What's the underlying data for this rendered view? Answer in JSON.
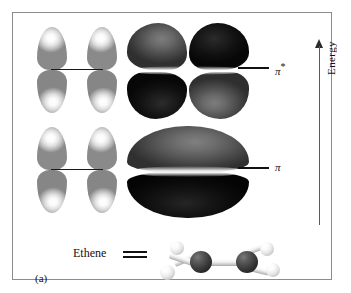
{
  "figure": {
    "caption": "(a)",
    "border_color": "#8c8c8c",
    "background": "#ffffff"
  },
  "energy_axis": {
    "label": "Energy",
    "direction": "up",
    "arrow_icon": "up-arrow-icon"
  },
  "energy_levels": [
    {
      "id": "antibonding",
      "symbol": "π",
      "superscript": "*",
      "label": "π*",
      "relative_energy": "higher"
    },
    {
      "id": "bonding",
      "symbol": "π",
      "superscript": "",
      "label": "π",
      "relative_energy": "lower"
    }
  ],
  "orbital_diagrams": [
    {
      "id": "p-orbital-pair-antibonding",
      "type": "atomic-p-orbital-pair",
      "lobe_count": 4,
      "lobe_shading": "light",
      "bond_line": true
    },
    {
      "id": "p-orbital-pair-bonding",
      "type": "atomic-p-orbital-pair",
      "lobe_count": 4,
      "lobe_shading": "light",
      "bond_line": true
    }
  ],
  "molecular_orbitals": [
    {
      "id": "pi-star-surface",
      "name": "pi-antibonding-orbital",
      "lobe_count": 4,
      "phases": [
        "gray",
        "black",
        "black",
        "gray"
      ],
      "nodal_plane": true
    },
    {
      "id": "pi-surface",
      "name": "pi-bonding-orbital",
      "lobe_count": 2,
      "phases": [
        "gray",
        "black"
      ],
      "nodal_plane": true
    }
  ],
  "molecule": {
    "name": "Ethene",
    "bond_symbol": "=",
    "bond_order": 2,
    "model_type": "ball-and-stick",
    "carbon_count": 2,
    "hydrogen_count": 4,
    "carbon_color": "#3d3d3d",
    "hydrogen_color": "#e6e6e6"
  },
  "colors": {
    "frame": "#8c8c8c",
    "text": "#111111",
    "positive_phase": "#6e6e6e",
    "negative_phase": "#141414"
  }
}
